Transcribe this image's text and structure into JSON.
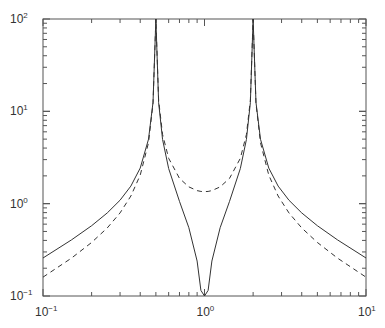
{
  "chart_data": {
    "type": "line",
    "title": "",
    "xlabel": "",
    "ylabel": "",
    "xscale": "log",
    "yscale": "log",
    "xlim": [
      0.1,
      10
    ],
    "ylim": [
      0.1,
      100
    ],
    "grid": false,
    "legend": null,
    "x_tick_labels": [
      {
        "value": 0.1,
        "base": "10",
        "exp": "−1"
      },
      {
        "value": 1,
        "base": "10",
        "exp": "0"
      },
      {
        "value": 10,
        "base": "10",
        "exp": "1"
      }
    ],
    "y_tick_labels": [
      {
        "value": 0.1,
        "base": "10",
        "exp": "−1"
      },
      {
        "value": 1,
        "base": "10",
        "exp": "0"
      },
      {
        "value": 10,
        "base": "10",
        "exp": "1"
      },
      {
        "value": 100,
        "base": "10",
        "exp": "2"
      }
    ],
    "series": [
      {
        "name": "solid",
        "style": "solid",
        "color": "#333333",
        "x": [
          0.1,
          0.15,
          0.2,
          0.25,
          0.3,
          0.35,
          0.4,
          0.45,
          0.48,
          0.5,
          0.52,
          0.55,
          0.6,
          0.7,
          0.8,
          0.9,
          0.95,
          1.0,
          1.053,
          1.111,
          1.25,
          1.429,
          1.667,
          1.818,
          1.923,
          2.0,
          2.083,
          2.222,
          2.5,
          2.857,
          3.333,
          4.0,
          5.0,
          6.667,
          10.0
        ],
        "y": [
          0.258,
          0.405,
          0.577,
          0.794,
          1.09,
          1.55,
          2.43,
          4.98,
          12.5,
          100,
          12.4,
          4.95,
          2.4,
          1.06,
          0.549,
          0.239,
          0.115,
          0.1,
          0.115,
          0.239,
          0.549,
          1.06,
          2.4,
          4.95,
          12.4,
          100,
          12.5,
          4.98,
          2.43,
          1.55,
          1.09,
          0.794,
          0.577,
          0.405,
          0.258
        ]
      },
      {
        "name": "dashed",
        "style": "dashed",
        "color": "#333333",
        "x": [
          0.1,
          0.15,
          0.2,
          0.25,
          0.3,
          0.35,
          0.4,
          0.45,
          0.48,
          0.5,
          0.52,
          0.55,
          0.6,
          0.7,
          0.8,
          0.9,
          0.95,
          1.0,
          1.053,
          1.111,
          1.25,
          1.429,
          1.667,
          1.818,
          1.923,
          2.0,
          2.083,
          2.222,
          2.5,
          2.857,
          3.333,
          4.0,
          5.0,
          6.667,
          10.0
        ],
        "y": [
          0.16,
          0.257,
          0.38,
          0.546,
          0.794,
          1.21,
          2.04,
          4.56,
          12.2,
          100,
          13.2,
          5.61,
          3.1,
          1.88,
          1.52,
          1.385,
          1.357,
          1.35,
          1.357,
          1.385,
          1.52,
          1.88,
          3.1,
          5.61,
          13.2,
          100,
          12.2,
          4.56,
          2.04,
          1.21,
          0.794,
          0.546,
          0.38,
          0.257,
          0.16
        ]
      }
    ]
  },
  "style": {
    "axis_color": "#555555",
    "line_color": "#333333",
    "background": "#ffffff"
  }
}
